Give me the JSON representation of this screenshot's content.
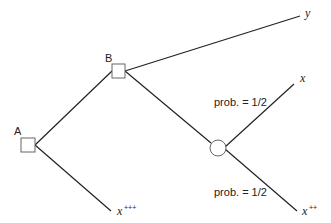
{
  "diagram": {
    "type": "decision-tree",
    "nodes": {
      "A": {
        "label": "A",
        "shape": "square",
        "kind": "decision"
      },
      "B": {
        "label": "B",
        "shape": "square",
        "kind": "decision"
      },
      "C": {
        "label": "",
        "shape": "circle",
        "kind": "chance"
      }
    },
    "outcomes": {
      "y": {
        "base": "y",
        "sup": ""
      },
      "x": {
        "base": "x",
        "sup": ""
      },
      "x_pp": {
        "base": "x",
        "sup": "++"
      },
      "x_ppp": {
        "base": "x",
        "sup": "+++"
      }
    },
    "edges": [
      {
        "from": "A",
        "to": "B"
      },
      {
        "from": "A",
        "to": "x_ppp"
      },
      {
        "from": "B",
        "to": "y"
      },
      {
        "from": "B",
        "to": "C"
      },
      {
        "from": "C",
        "to": "x",
        "label": "prob. = 1/2"
      },
      {
        "from": "C",
        "to": "x_pp",
        "label": "prob. = 1/2"
      }
    ],
    "prob_upper": "prob. = 1/2",
    "prob_lower": "prob. = 1/2"
  },
  "colors": {
    "line": "#222222",
    "node_stroke": "#666666",
    "background": "#ffffff"
  }
}
